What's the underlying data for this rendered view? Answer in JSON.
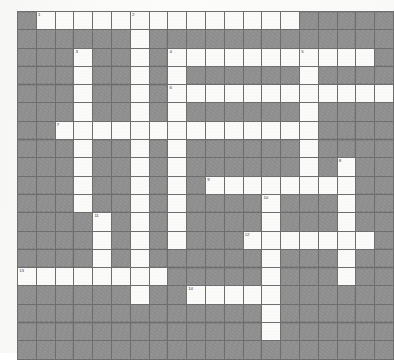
{
  "document": {
    "type": "crossword-puzzle-grid",
    "title": "Crossword Puzzle Grid",
    "columns": 20,
    "rows": 19,
    "colors": {
      "blocked_cell": "#9c9c9c",
      "open_cell": "#fbfbfa",
      "grid_line": "#6e6e6e",
      "outer_border": "#5b5b5b",
      "page_background": "#fdfdfc",
      "number_text": "#3a3a3a"
    }
  },
  "grid": {
    "legend": {
      "1": "open / writable white square",
      "0": "blocked / shaded square"
    },
    "cells": [
      [
        0,
        1,
        1,
        1,
        1,
        1,
        1,
        1,
        1,
        1,
        1,
        1,
        1,
        1,
        1,
        0,
        0,
        0,
        0,
        0
      ],
      [
        0,
        0,
        0,
        0,
        0,
        0,
        1,
        0,
        0,
        0,
        0,
        0,
        0,
        0,
        0,
        0,
        0,
        0,
        0,
        0
      ],
      [
        0,
        0,
        0,
        1,
        0,
        0,
        1,
        0,
        1,
        1,
        1,
        1,
        1,
        1,
        1,
        1,
        1,
        1,
        1,
        0
      ],
      [
        0,
        0,
        0,
        1,
        0,
        0,
        1,
        0,
        1,
        0,
        0,
        0,
        0,
        0,
        0,
        1,
        0,
        0,
        0,
        0
      ],
      [
        0,
        0,
        0,
        1,
        0,
        0,
        1,
        0,
        1,
        1,
        1,
        1,
        1,
        1,
        1,
        1,
        1,
        1,
        1,
        1
      ],
      [
        0,
        0,
        0,
        1,
        0,
        0,
        1,
        0,
        1,
        0,
        0,
        0,
        0,
        0,
        0,
        1,
        0,
        0,
        0,
        0
      ],
      [
        0,
        0,
        1,
        1,
        1,
        1,
        1,
        1,
        1,
        1,
        1,
        1,
        1,
        1,
        1,
        1,
        0,
        0,
        0,
        0
      ],
      [
        0,
        0,
        0,
        1,
        0,
        0,
        1,
        0,
        1,
        0,
        0,
        0,
        0,
        0,
        0,
        1,
        0,
        0,
        0,
        0
      ],
      [
        0,
        0,
        0,
        1,
        0,
        0,
        1,
        0,
        1,
        0,
        0,
        0,
        0,
        0,
        0,
        1,
        0,
        1,
        0,
        0
      ],
      [
        0,
        0,
        0,
        1,
        0,
        0,
        1,
        0,
        1,
        0,
        1,
        1,
        1,
        1,
        1,
        1,
        1,
        1,
        0,
        0
      ],
      [
        0,
        0,
        0,
        1,
        0,
        0,
        1,
        0,
        1,
        0,
        0,
        0,
        0,
        1,
        0,
        0,
        0,
        1,
        0,
        0
      ],
      [
        0,
        0,
        0,
        0,
        1,
        0,
        1,
        0,
        1,
        0,
        0,
        0,
        0,
        1,
        0,
        0,
        0,
        1,
        0,
        0
      ],
      [
        0,
        0,
        0,
        0,
        1,
        0,
        1,
        0,
        1,
        0,
        0,
        0,
        1,
        1,
        1,
        1,
        1,
        1,
        1,
        0
      ],
      [
        0,
        0,
        0,
        0,
        1,
        0,
        1,
        0,
        0,
        0,
        0,
        0,
        0,
        1,
        0,
        0,
        0,
        1,
        0,
        0
      ],
      [
        1,
        1,
        1,
        1,
        1,
        1,
        1,
        1,
        0,
        0,
        0,
        0,
        0,
        1,
        0,
        0,
        0,
        1,
        0,
        0
      ],
      [
        0,
        0,
        0,
        0,
        0,
        0,
        1,
        0,
        0,
        1,
        1,
        1,
        1,
        1,
        0,
        0,
        0,
        0,
        0,
        0
      ],
      [
        0,
        0,
        0,
        0,
        0,
        0,
        0,
        0,
        0,
        0,
        0,
        0,
        0,
        1,
        0,
        0,
        0,
        0,
        0,
        0
      ],
      [
        0,
        0,
        0,
        0,
        0,
        0,
        0,
        0,
        0,
        0,
        0,
        0,
        0,
        1,
        0,
        0,
        0,
        0,
        0,
        0
      ],
      [
        0,
        0,
        0,
        0,
        0,
        0,
        0,
        0,
        0,
        0,
        0,
        0,
        0,
        0,
        0,
        0,
        0,
        0,
        0,
        0
      ]
    ],
    "numbers": [
      {
        "label": "1",
        "row": 1,
        "col": 2
      },
      {
        "label": "2",
        "row": 1,
        "col": 7
      },
      {
        "label": "3",
        "row": 3,
        "col": 4
      },
      {
        "label": "4",
        "row": 3,
        "col": 9
      },
      {
        "label": "5",
        "row": 3,
        "col": 16
      },
      {
        "label": "6",
        "row": 5,
        "col": 9
      },
      {
        "label": "7",
        "row": 7,
        "col": 3
      },
      {
        "label": "8",
        "row": 9,
        "col": 18
      },
      {
        "label": "9",
        "row": 10,
        "col": 11
      },
      {
        "label": "10",
        "row": 11,
        "col": 14
      },
      {
        "label": "11",
        "row": 12,
        "col": 5
      },
      {
        "label": "12",
        "row": 13,
        "col": 13
      },
      {
        "label": "13",
        "row": 15,
        "col": 1
      },
      {
        "label": "14",
        "row": 16,
        "col": 10
      }
    ]
  }
}
